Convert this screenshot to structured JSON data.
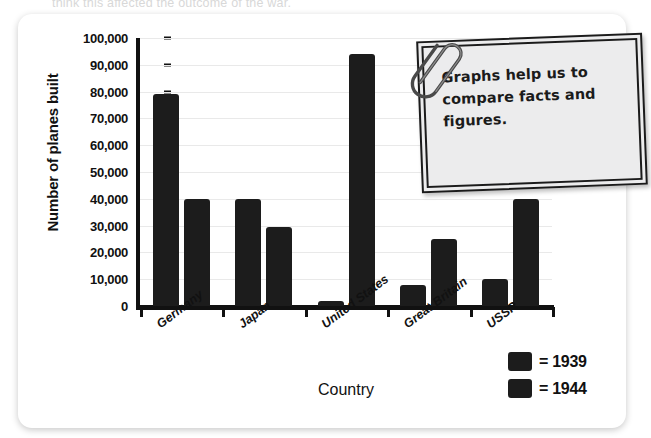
{
  "page": {
    "cropped_text_above": "think this affected the outcome of the war."
  },
  "note": {
    "text": "Graphs help us to compare facts and figures.",
    "icon": "paperclip-icon",
    "border_color": "#1b1b1b",
    "fill_color": "#ececed"
  },
  "legend": {
    "items": [
      {
        "label": "= 1939",
        "color": "#1c1c1c"
      },
      {
        "label": "= 1944",
        "color": "#1c1c1c"
      }
    ]
  },
  "chart_data": {
    "type": "bar",
    "title": "",
    "xlabel": "Country",
    "ylabel": "Number of planes built",
    "categories": [
      "Germany",
      "Japan",
      "United States",
      "Great Britain",
      "USSR"
    ],
    "series": [
      {
        "name": "1939",
        "values": [
          79000,
          40000,
          2000,
          8000,
          10000
        ]
      },
      {
        "name": "1944",
        "values": [
          40000,
          29500,
          94000,
          25000,
          40000
        ]
      }
    ],
    "ylim": [
      0,
      100000
    ],
    "ytick_values": [
      0,
      10000,
      20000,
      30000,
      40000,
      50000,
      60000,
      70000,
      80000,
      90000,
      100000
    ],
    "ytick_labels": [
      "0",
      "10,000",
      "20,000",
      "30,000",
      "40,000",
      "50,000",
      "60,000",
      "70,000",
      "80,000",
      "90,000",
      "100,000"
    ],
    "grid": true,
    "legend_position": "bottom-right",
    "bar_color": "#1c1c1c"
  }
}
